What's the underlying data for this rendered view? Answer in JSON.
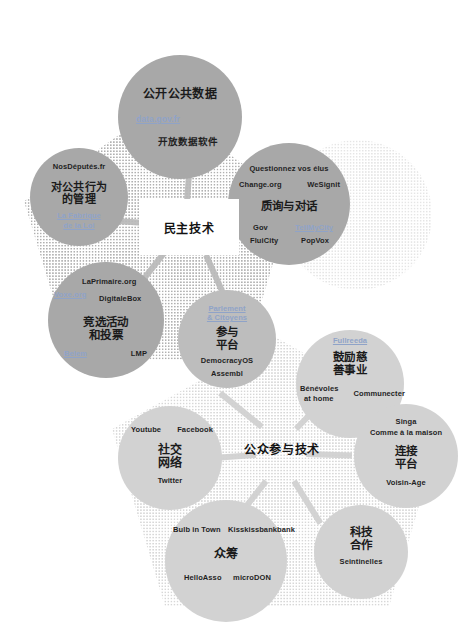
{
  "figure": {
    "background": "#ffffff",
    "accent_link_color": "#8fa3c8",
    "circle_colors": [
      "#a8a8a8",
      "#bdbdbd",
      "#d2d2d2",
      "#dedede"
    ]
  },
  "hubs": {
    "top": "民主技术",
    "bottom": "公众参与技术"
  },
  "clusters": {
    "open_data": {
      "title": "公开公共数据",
      "link": "data.gov.fr",
      "item2": "开放数据软件"
    },
    "public_action": {
      "title_line1": "对公共行为",
      "title_line2": "的管理",
      "item_top": "NosDéputés.fr",
      "link_line1": "La Fabrique",
      "link_line2": "de la Loi"
    },
    "consult": {
      "title": "质询与对话",
      "item_top": "Questionnez vos élus",
      "item_left": "Change.org",
      "item_right": "WeSignit",
      "item_gov": "Gov",
      "link_tellmycity": "TellMyCity",
      "item_fluicity": "FluiCity",
      "item_popvox": "PopVox"
    },
    "campaign": {
      "title_line1": "竞选活动",
      "title_line2": "和投票",
      "item_laprimaire": "LaPrimaire.org",
      "link_voxe": "Voxe.org",
      "item_digitalebox": "DigitaleBox",
      "link_belem": "Belem",
      "item_lmp": "LMP"
    },
    "platform": {
      "title_line1": "参与",
      "title_line2": "平台",
      "link_line1": "Parlement",
      "link_line2": "& Citoyens",
      "item_democracyos": "DemocracyOS",
      "item_assembl": "Assembl"
    },
    "charity": {
      "title_line1": "鼓励慈",
      "title_line2": "善事业",
      "link": "Fullreeda",
      "item_benevoles1": "Bénévoles",
      "item_benevoles2": "at home",
      "item_communecter": "Communecter"
    },
    "connect": {
      "title_line1": "连接",
      "title_line2": "平台",
      "item_singa": "Singa",
      "item_comme": "Comme à la maison",
      "item_voisinage": "Voisin-Age"
    },
    "social": {
      "title_line1": "社交",
      "title_line2": "网络",
      "item_youtube": "Youtube",
      "item_facebook": "Facebook",
      "item_twitter": "Twitter"
    },
    "crowdfunding": {
      "title": "众筹",
      "item_bulb": "Bulb in Town",
      "item_kiss": "Kisskissbankbank",
      "item_helloasso": "HelloAsso",
      "item_microdon": "microDON"
    },
    "tech_coop": {
      "title_line1": "科技",
      "title_line2": "合作",
      "item_seintinelles": "Seintinelles"
    }
  }
}
